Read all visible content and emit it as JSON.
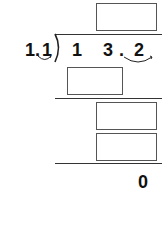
{
  "problem": {
    "type": "long-division",
    "divisor": {
      "digits": [
        "1",
        ".",
        "1"
      ],
      "value": "1.1"
    },
    "dividend": {
      "digits": [
        "1",
        "3",
        ".",
        "2"
      ],
      "value": "13.2"
    },
    "remainder": "0"
  },
  "answer_boxes": [
    {
      "id": "quotient",
      "value": ""
    },
    {
      "id": "first-product",
      "value": ""
    },
    {
      "id": "second-partial",
      "value": ""
    },
    {
      "id": "second-product",
      "value": ""
    }
  ],
  "colors": {
    "ink": "#111111",
    "box_border": "#555555",
    "line": "#333333"
  }
}
